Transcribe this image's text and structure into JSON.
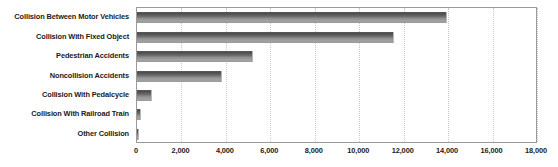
{
  "chart_data": {
    "type": "bar",
    "orientation": "horizontal",
    "title": "",
    "subtitle": "",
    "xlabel": "",
    "ylabel": "",
    "categories": [
      "Collision Between Motor Vehicles",
      "Collision With Fixed Object",
      "Pedestrian Accidents",
      "Noncollision Accidents",
      "Collision With Pedalcycle",
      "Collision With Railroad Train",
      "Other Collision"
    ],
    "values": [
      13950,
      11570,
      5220,
      3830,
      680,
      190,
      70
    ],
    "xlim": [
      0,
      18000
    ],
    "xticks": [
      0,
      2000,
      4000,
      6000,
      8000,
      10000,
      12000,
      14000,
      16000,
      18000
    ],
    "xtick_labels": [
      "0",
      "2,000",
      "4,000",
      "6,000",
      "8,000",
      "10,000",
      "12,000",
      "14,000",
      "16,000",
      "18,000"
    ],
    "grid": "vertical-dotted",
    "legend": "none",
    "bar_color": "#6f6f6f",
    "grid_color": "#c9c9c9",
    "axis_color": "#9a9a9a",
    "text_color": "#1a1a1a"
  }
}
